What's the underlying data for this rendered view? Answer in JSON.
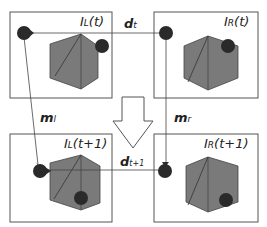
{
  "frames": {
    "top_left": {
      "label": "I",
      "sub": "L",
      "arg": "(t)"
    },
    "top_right": {
      "label": "I",
      "sub": "R",
      "arg": "(t)"
    },
    "bottom_left": {
      "label": "I",
      "sub": "L",
      "arg": "(t+1)"
    },
    "bottom_right": {
      "label": "I",
      "sub": "R",
      "arg": "(t+1)"
    }
  },
  "vectors": {
    "d_t": {
      "main": "d",
      "sub": "t"
    },
    "d_t1": {
      "main": "d",
      "sub": "t+1"
    },
    "m_l": {
      "main": "m",
      "sub": "l"
    },
    "m_r": {
      "main": "m",
      "sub": "r"
    }
  },
  "colors": {
    "frame": "#555555",
    "cube": "#7a7a7a",
    "dot": "#2a2a2a",
    "line": "#444444"
  }
}
